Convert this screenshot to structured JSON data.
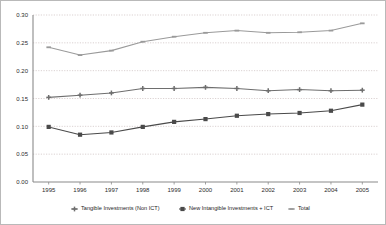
{
  "chart_data": {
    "type": "line",
    "title": "",
    "xlabel": "",
    "ylabel": "",
    "x": [
      "1995",
      "1996",
      "1997",
      "1998",
      "1999",
      "2000",
      "2001",
      "2002",
      "2003",
      "2004",
      "2005"
    ],
    "ylim": [
      0.0,
      0.3
    ],
    "ytick_labels": [
      "0.00",
      "0.05",
      "0.10",
      "0.15",
      "0.20",
      "0.25",
      "0.30"
    ],
    "ytick_values": [
      0.0,
      0.05,
      0.1,
      0.15,
      0.2,
      0.25,
      0.3
    ],
    "grid": "horizontal-dotted",
    "legend_position": "bottom",
    "series": [
      {
        "name": "Tangible Investments (Non ICT)",
        "marker": "cross",
        "color": "#6e6e6e",
        "values": [
          0.152,
          0.156,
          0.16,
          0.168,
          0.168,
          0.17,
          0.168,
          0.164,
          0.166,
          0.164,
          0.165
        ]
      },
      {
        "name": "New Intangible Investments + ICT",
        "marker": "square",
        "color": "#4a4a4a",
        "values": [
          0.099,
          0.085,
          0.089,
          0.099,
          0.108,
          0.113,
          0.119,
          0.122,
          0.124,
          0.128,
          0.139
        ]
      },
      {
        "name": "Total",
        "marker": "dash",
        "color": "#9a9a9a",
        "values": [
          0.242,
          0.228,
          0.236,
          0.252,
          0.261,
          0.268,
          0.272,
          0.268,
          0.269,
          0.272,
          0.285
        ]
      }
    ]
  },
  "legend": {
    "items": [
      {
        "label": "Tangible Investments (Non ICT)"
      },
      {
        "label": "New Intangible Investments + ICT"
      },
      {
        "label": "Total"
      }
    ]
  },
  "colors": {
    "border": "#b9b9b9",
    "grid": "#c2b4b4",
    "axis": "#8a8a8a",
    "background": "#ffffff"
  }
}
